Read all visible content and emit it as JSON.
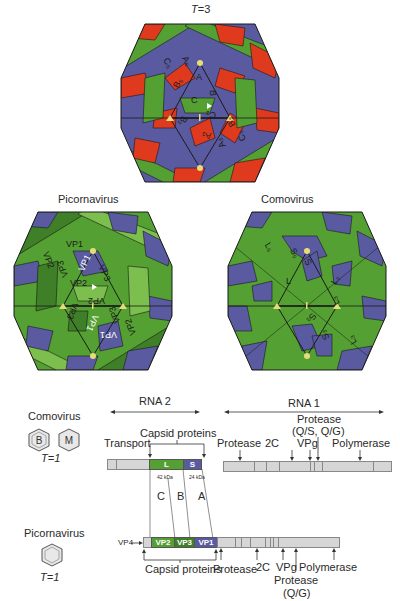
{
  "colors": {
    "red": "#e03a1e",
    "blue": "#5a5aa0",
    "green": "#54a032",
    "dark_green": "#3f7f27",
    "light_green": "#7cbf4e",
    "yellow_marker": "#e8dc7a",
    "genome_gray": "#d6d6d6",
    "outline": "#1a1a1a"
  },
  "t3": {
    "title_prefix": "T",
    "title_suffix": "=3",
    "labels": {
      "A5": "A₅",
      "A": "A",
      "C5": "C₅",
      "B5": "B₅",
      "B": "B",
      "C": "C",
      "C2": "C₂",
      "B2": "B₂",
      "A2": "A₂",
      "B3": "B₃",
      "A3": "A₃",
      "C3": "C₃"
    }
  },
  "picornavirus": {
    "title": "Picornavirus",
    "labels": [
      "VP1",
      "VP2",
      "VP3",
      "VP1",
      "VP3",
      "VP2",
      "VP3",
      "VP2",
      "VP3",
      "VP1",
      "VP1",
      "VP2"
    ]
  },
  "comovirus": {
    "title": "Comovirus",
    "labels": [
      "L₅",
      "S₅",
      "S",
      "L",
      "L₂",
      "L₃",
      "S₂",
      "S₃",
      "L₃"
    ]
  },
  "genome": {
    "rna2_label": "RNA 2",
    "rna1_label": "RNA 1",
    "comovirus_title": "Comovirus",
    "comovirus_icons": [
      "B",
      "M"
    ],
    "comovirus_t": "T=1",
    "transport_label": "Transport",
    "capsid_label_top": "Capsid proteins",
    "L_label": "L",
    "S_label": "S",
    "kda_42": "42 kDa",
    "kda_24": "24 kDa",
    "domain_C": "C",
    "domain_B": "B",
    "domain_A": "A",
    "rna1_protease": "Protease",
    "rna1_2c": "2C",
    "rna1_vpg": "VPg",
    "rna1_protease2_line1": "Protease",
    "rna1_protease2_line2": "(Q/S, Q/G)",
    "rna1_polymerase": "Polymerase",
    "picornavirus_title": "Picornavirus",
    "picornavirus_t": "T=1",
    "vp4_label": "VP4",
    "vp2_label": "VP2",
    "vp3_label": "VP3",
    "vp1_label": "VP1",
    "capsid_label_bottom": "Capsid proteins",
    "pico_protease": "Protease",
    "pico_2c": "2C",
    "pico_vpg": "VPg",
    "pico_polymerase": "Polymerase",
    "pico_protease2_line1": "Protease",
    "pico_protease2_line2": "(Q/G)"
  }
}
